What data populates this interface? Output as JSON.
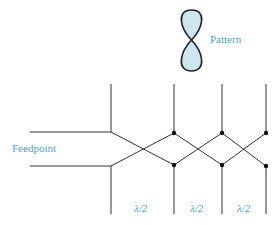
{
  "diagram": {
    "type": "log-periodic dipole array feed (crossed transmission line)",
    "pattern_label": "Pattern",
    "feedpoint_label": "Feedpoint",
    "spacing_labels": [
      "λ/2",
      "λ/2",
      "λ/2"
    ],
    "colors": {
      "line": "#333333",
      "label": "#4fa3c9",
      "lobe_fill": "#cfe6ee",
      "lobe_stroke": "#222222"
    }
  }
}
